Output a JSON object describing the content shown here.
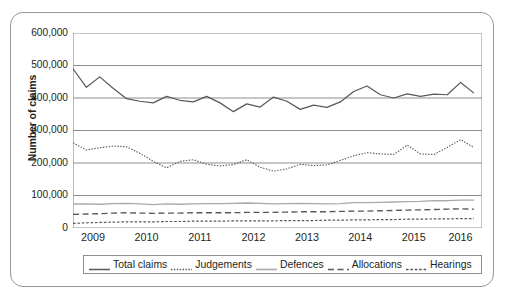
{
  "chart_data": {
    "type": "line",
    "title": "",
    "xlabel": "",
    "ylabel": "Number of claims",
    "ylim": [
      0,
      600000
    ],
    "ytick_labels": [
      "600,000",
      "500,000",
      "400,000",
      "300,000",
      "200,000",
      "100,000",
      "0"
    ],
    "ytick_values": [
      600000,
      500000,
      400000,
      300000,
      200000,
      100000,
      0
    ],
    "grid": true,
    "legend_position": "bottom",
    "x_tick_labels": [
      "2009",
      "2010",
      "2011",
      "2012",
      "2013",
      "2014",
      "2015",
      "2016"
    ],
    "x_minor_ticks_per_year": 4,
    "x": [
      "2009 Q1",
      "2009 Q2",
      "2009 Q3",
      "2009 Q4",
      "2010 Q1",
      "2010 Q2",
      "2010 Q3",
      "2010 Q4",
      "2011 Q1",
      "2011 Q2",
      "2011 Q3",
      "2011 Q4",
      "2012 Q1",
      "2012 Q2",
      "2012 Q3",
      "2012 Q4",
      "2013 Q1",
      "2013 Q2",
      "2013 Q3",
      "2013 Q4",
      "2014 Q1",
      "2014 Q2",
      "2014 Q3",
      "2014 Q4",
      "2015 Q1",
      "2015 Q2",
      "2015 Q3",
      "2015 Q4",
      "2016 Q1",
      "2016 Q2",
      "2016 Q3"
    ],
    "series": [
      {
        "name": "Total claims",
        "style": "solid",
        "color": "#58595b",
        "values": [
          490000,
          433000,
          465000,
          430000,
          398000,
          390000,
          385000,
          405000,
          393000,
          388000,
          405000,
          385000,
          358000,
          382000,
          372000,
          403000,
          390000,
          365000,
          378000,
          371000,
          388000,
          420000,
          437000,
          410000,
          400000,
          413000,
          405000,
          412000,
          410000,
          448000,
          415000
        ]
      },
      {
        "name": "Judgements",
        "style": "dotted",
        "color": "#58595b",
        "values": [
          262000,
          240000,
          247000,
          252000,
          250000,
          230000,
          205000,
          185000,
          205000,
          210000,
          196000,
          191000,
          195000,
          210000,
          187000,
          175000,
          182000,
          196000,
          192000,
          194000,
          208000,
          222000,
          232000,
          228000,
          226000,
          255000,
          228000,
          226000,
          248000,
          272000,
          247000
        ]
      },
      {
        "name": "Defences",
        "style": "solid-light",
        "color": "#a7a9ac",
        "values": [
          74000,
          74000,
          73000,
          75000,
          76000,
          74000,
          72000,
          74000,
          73000,
          74000,
          75000,
          75000,
          76000,
          77000,
          76000,
          74000,
          75000,
          76000,
          75000,
          74000,
          75000,
          78000,
          78000,
          79000,
          80000,
          81000,
          82000,
          84000,
          84000,
          86000,
          86000
        ]
      },
      {
        "name": "Allocations",
        "style": "dashed",
        "color": "#58595b",
        "values": [
          42000,
          43000,
          44000,
          46000,
          47000,
          46000,
          45000,
          46000,
          46000,
          47000,
          47000,
          47000,
          47000,
          48000,
          48000,
          48000,
          49000,
          50000,
          50000,
          50000,
          51000,
          52000,
          52000,
          53000,
          54000,
          55000,
          56000,
          57000,
          58000,
          59000,
          58000
        ]
      },
      {
        "name": "Hearings",
        "style": "fine-dashed",
        "color": "#58595b",
        "values": [
          14000,
          16000,
          17000,
          18000,
          19000,
          19000,
          19000,
          20000,
          20000,
          21000,
          21000,
          21000,
          22000,
          22000,
          22000,
          22000,
          23000,
          23000,
          23000,
          24000,
          24000,
          25000,
          25000,
          26000,
          26000,
          27000,
          27000,
          28000,
          28000,
          29000,
          29000
        ]
      }
    ]
  },
  "legend": {
    "items": [
      {
        "label": "Total claims",
        "style": "solid"
      },
      {
        "label": "Judgements",
        "style": "dotted"
      },
      {
        "label": "Defences",
        "style": "solid-light"
      },
      {
        "label": "Allocations",
        "style": "dashed"
      },
      {
        "label": "Hearings",
        "style": "fine-dashed"
      }
    ]
  },
  "colors": {
    "line_dark": "#58595b",
    "line_light": "#a7a9ac",
    "grid": "#8d8d8d",
    "frame": "#9a9a9a",
    "text": "#231f20",
    "background": "#ffffff"
  }
}
